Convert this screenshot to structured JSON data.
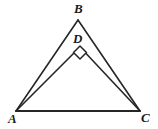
{
  "figure": {
    "name": "geometry-figure-two-nested-triangles",
    "background_color": "#ffffff",
    "stroke_color": "#262626",
    "label_color": "#1a1a1a",
    "width": 158,
    "height": 129,
    "points": {
      "A": {
        "label": "A",
        "x": 16,
        "y": 111
      },
      "B": {
        "label": "B",
        "x": 78,
        "y": 20
      },
      "C": {
        "label": "C",
        "x": 140,
        "y": 111
      },
      "D": {
        "label": "D",
        "x": 80,
        "y": 47
      }
    },
    "segments": [
      {
        "name": "segment-AB",
        "from": "A",
        "to": "B"
      },
      {
        "name": "segment-BC",
        "from": "B",
        "to": "C"
      },
      {
        "name": "segment-AC",
        "from": "A",
        "to": "C"
      },
      {
        "name": "segment-AD",
        "from": "A",
        "to": "D"
      },
      {
        "name": "segment-DC",
        "from": "D",
        "to": "C"
      }
    ],
    "angle_markers": [
      {
        "name": "right-angle-marker-at-D",
        "at": "D",
        "type": "right-angle-square",
        "degrees": 90
      }
    ]
  }
}
